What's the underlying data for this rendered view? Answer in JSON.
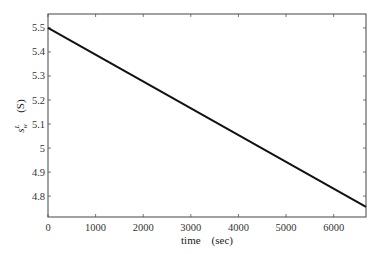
{
  "chart_data": {
    "type": "line",
    "title": "",
    "xlabel": "time    (sec)",
    "ylabel": "s_w^L    (S)",
    "ylabel_parts": {
      "symbol": "s",
      "superscript": "L",
      "subscript": "w",
      "unit": "(S)"
    },
    "xlim": [
      0,
      6680
    ],
    "ylim": [
      4.713,
      5.558
    ],
    "xticks": [
      0,
      1000,
      2000,
      3000,
      4000,
      5000,
      6000
    ],
    "yticks": [
      4.8,
      4.9,
      5,
      5.1,
      5.2,
      5.3,
      5.4,
      5.5
    ],
    "ytick_labels": [
      "4.8",
      "4.9",
      "5",
      "5.1",
      "5.2",
      "5.3",
      "5.4",
      "5.5"
    ],
    "xtick_labels": [
      "0",
      "1000",
      "2000",
      "3000",
      "4000",
      "5000",
      "6000"
    ],
    "grid": false,
    "legend": null,
    "series": [
      {
        "name": "s_w^L",
        "color": "#111111",
        "x": [
          0,
          6680
        ],
        "y": [
          5.5,
          4.755
        ]
      }
    ]
  }
}
